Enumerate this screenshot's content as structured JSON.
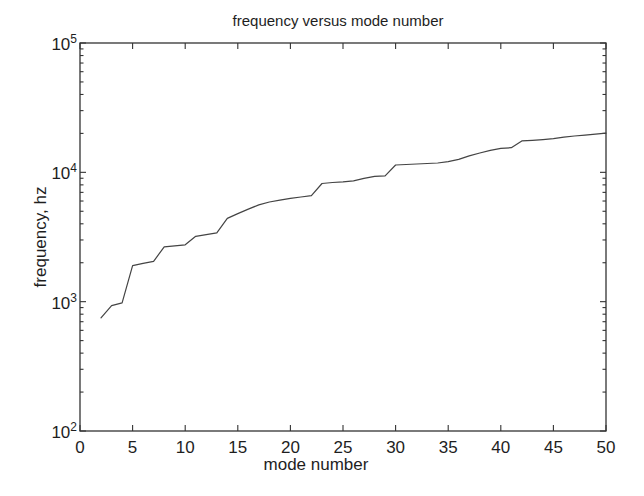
{
  "colors": {
    "background": "#ffffff",
    "axis": "#333333",
    "line": "#444444",
    "text": "#1e1e1e"
  },
  "chart_data": {
    "type": "line",
    "title": "frequency versus mode number",
    "xlabel": "mode number",
    "ylabel": "frequency, hz",
    "x_scale": "linear",
    "y_scale": "log",
    "xlim": [
      0,
      50
    ],
    "ylim": [
      100,
      100000
    ],
    "x_ticks": [
      0,
      5,
      10,
      15,
      20,
      25,
      30,
      35,
      40,
      45,
      50
    ],
    "y_tick_exponents": [
      2,
      3,
      4,
      5
    ],
    "y_minor_multiples": [
      2,
      3,
      4,
      5,
      6,
      7,
      8,
      9
    ],
    "grid": false,
    "legend": false,
    "series": [
      {
        "name": "mode frequencies",
        "x": [
          2,
          3,
          4,
          5,
          6,
          7,
          8,
          9,
          10,
          11,
          12,
          13,
          14,
          15,
          16,
          17,
          18,
          19,
          20,
          21,
          22,
          23,
          24,
          25,
          26,
          27,
          28,
          29,
          30,
          31,
          32,
          33,
          34,
          35,
          36,
          37,
          38,
          39,
          40,
          41,
          42,
          43,
          44,
          45,
          46,
          47,
          48,
          49,
          50
        ],
        "y": [
          750,
          930,
          980,
          1900,
          1980,
          2050,
          2650,
          2700,
          2750,
          3200,
          3300,
          3400,
          4400,
          4800,
          5200,
          5600,
          5900,
          6100,
          6300,
          6450,
          6600,
          8200,
          8350,
          8450,
          8600,
          9000,
          9300,
          9400,
          11400,
          11500,
          11600,
          11700,
          11800,
          12100,
          12600,
          13400,
          14100,
          14800,
          15300,
          15500,
          17500,
          17700,
          17900,
          18200,
          18700,
          19100,
          19400,
          19700,
          20100
        ]
      }
    ]
  }
}
